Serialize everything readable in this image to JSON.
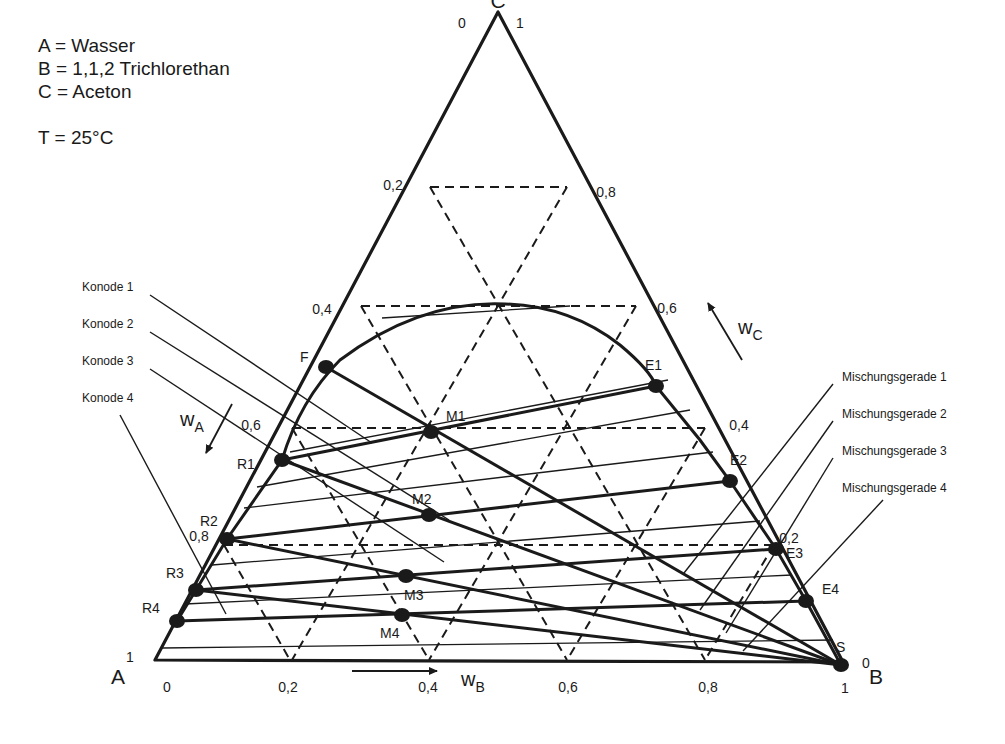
{
  "legend": {
    "a": "A = Wasser",
    "b": "B = 1,1,2 Trichlorethan",
    "c": "C = Aceton",
    "temperature": "T = 25°C"
  },
  "colors": {
    "ink": "#1a1a1a",
    "background": "#ffffff"
  },
  "vertices": {
    "A": {
      "label": "A",
      "x": 155,
      "y": 660,
      "lx": 118,
      "ly": 684
    },
    "B": {
      "label": "B",
      "x": 843,
      "y": 662,
      "lx": 868,
      "ly": 684
    },
    "C": {
      "label": "C",
      "x": 498,
      "y": 12,
      "lx": 498,
      "ly": 6
    }
  },
  "axes": {
    "wB_label": "w",
    "wB_sub": "B",
    "wA_label": "w",
    "wA_sub": "A",
    "wC_label": "w",
    "wC_sub": "C",
    "bottom_ticks": [
      {
        "t": "0",
        "x": 167,
        "y": 692
      },
      {
        "t": "0,2",
        "x": 288,
        "y": 692
      },
      {
        "t": "0,4",
        "x": 428,
        "y": 692
      },
      {
        "t": "0,6",
        "x": 568,
        "y": 692
      },
      {
        "t": "0,8",
        "x": 708,
        "y": 692
      },
      {
        "t": "1",
        "x": 845,
        "y": 693
      }
    ],
    "left_ticks": [
      {
        "t": "0",
        "x": 462,
        "y": 28
      },
      {
        "t": "0,2",
        "x": 393,
        "y": 190
      },
      {
        "t": "0,4",
        "x": 322,
        "y": 314
      },
      {
        "t": "0,6",
        "x": 251,
        "y": 430
      },
      {
        "t": "0,8",
        "x": 199,
        "y": 541
      },
      {
        "t": "1",
        "x": 130,
        "y": 662
      }
    ],
    "right_ticks": [
      {
        "t": "1",
        "x": 520,
        "y": 28
      },
      {
        "t": "0,8",
        "x": 606,
        "y": 197
      },
      {
        "t": "0,6",
        "x": 667,
        "y": 313
      },
      {
        "t": "0,4",
        "x": 739,
        "y": 430
      },
      {
        "t": "0,2",
        "x": 789,
        "y": 543
      },
      {
        "t": "0",
        "x": 866,
        "y": 668
      }
    ]
  },
  "points": [
    {
      "name": "F",
      "x": 326,
      "y": 367,
      "lx": 300,
      "ly": 362
    },
    {
      "name": "R1",
      "x": 282,
      "y": 460,
      "lx": 237,
      "ly": 469
    },
    {
      "name": "R2",
      "x": 227,
      "y": 539,
      "lx": 200,
      "ly": 526
    },
    {
      "name": "R3",
      "x": 196,
      "y": 590,
      "lx": 166,
      "ly": 578
    },
    {
      "name": "R4",
      "x": 177,
      "y": 621,
      "lx": 142,
      "ly": 613
    },
    {
      "name": "M1",
      "x": 431,
      "y": 432,
      "lx": 446,
      "ly": 421
    },
    {
      "name": "M2",
      "x": 429,
      "y": 515,
      "lx": 412,
      "ly": 504
    },
    {
      "name": "M3",
      "x": 406,
      "y": 576,
      "lx": 404,
      "ly": 600
    },
    {
      "name": "M4",
      "x": 402,
      "y": 615,
      "lx": 380,
      "ly": 638
    },
    {
      "name": "E1",
      "x": 656,
      "y": 386,
      "lx": 645,
      "ly": 370
    },
    {
      "name": "E2",
      "x": 730,
      "y": 481,
      "lx": 730,
      "ly": 465
    },
    {
      "name": "E3",
      "x": 776,
      "y": 549,
      "lx": 786,
      "ly": 558
    },
    {
      "name": "E4",
      "x": 806,
      "y": 601,
      "lx": 822,
      "ly": 594
    },
    {
      "name": "S",
      "x": 841,
      "y": 665,
      "lx": 836,
      "ly": 652
    }
  ],
  "konoden": [
    {
      "label": "Konode 1",
      "lx": 82,
      "ly": 291,
      "from": [
        150,
        295
      ],
      "to": [
        372,
        443
      ]
    },
    {
      "label": "Konode 2",
      "lx": 82,
      "ly": 328,
      "from": [
        150,
        332
      ],
      "to": [
        449,
        520
      ]
    },
    {
      "label": "Konode 3",
      "lx": 82,
      "ly": 365,
      "from": [
        150,
        369
      ],
      "to": [
        444,
        562
      ]
    },
    {
      "label": "Konode 4",
      "lx": 82,
      "ly": 402,
      "from": [
        120,
        415
      ],
      "to": [
        226,
        614
      ]
    }
  ],
  "mischungsgeraden": [
    {
      "label": "Mischungsgerade 1",
      "lx": 842,
      "ly": 381,
      "from": [
        833,
        384
      ],
      "to": [
        684,
        573
      ]
    },
    {
      "label": "Mischungsgerade 2",
      "lx": 842,
      "ly": 418,
      "from": [
        833,
        421
      ],
      "to": [
        700,
        610
      ]
    },
    {
      "label": "Mischungsgerade 3",
      "lx": 842,
      "ly": 455,
      "from": [
        833,
        458
      ],
      "to": [
        726,
        633
      ]
    },
    {
      "label": "Mischungsgerade 4",
      "lx": 842,
      "ly": 492,
      "from": [
        883,
        500
      ],
      "to": [
        743,
        651
      ]
    }
  ],
  "chart_data": {
    "type": "ternary",
    "title": "",
    "components": {
      "A": "Wasser",
      "B": "1,1,2 Trichlorethan",
      "C": "Aceton"
    },
    "temperature": "25°C",
    "grid_step": 0.2,
    "tick_labels": [
      "0",
      "0,2",
      "0,4",
      "0,6",
      "0,8",
      "1"
    ],
    "binodal_curve": "drawn from R-side (near A) through plait region ~ w_C 0.6 to E-side (near B)",
    "feed": {
      "name": "F",
      "wA": 0.52,
      "wB": 0.0,
      "wC": 0.48
    },
    "solvent": {
      "name": "S",
      "wB": 1.0
    },
    "raffinates": [
      "R1",
      "R2",
      "R3",
      "R4"
    ],
    "extracts": [
      "E1",
      "E2",
      "E3",
      "E4"
    ],
    "mixing_points": [
      "M1",
      "M2",
      "M3",
      "M4"
    ],
    "tie_lines": [
      [
        "R1",
        "E1"
      ],
      [
        "R2",
        "E2"
      ],
      [
        "R3",
        "E3"
      ],
      [
        "R4",
        "E4"
      ]
    ],
    "annotations": [
      "Konode 1",
      "Konode 2",
      "Konode 3",
      "Konode 4",
      "Mischungsgerade 1",
      "Mischungsgerade 2",
      "Mischungsgerade 3",
      "Mischungsgerade 4"
    ]
  }
}
